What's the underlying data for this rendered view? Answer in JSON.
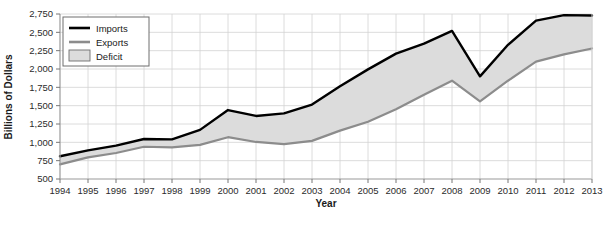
{
  "chart_data": {
    "type": "area",
    "title": "",
    "xlabel": "Year",
    "ylabel": "Billions of Dollars",
    "categories": [
      "1994",
      "1995",
      "1996",
      "1997",
      "1998",
      "1999",
      "2000",
      "2001",
      "2002",
      "2003",
      "2004",
      "2005",
      "2006",
      "2007",
      "2008",
      "2009",
      "2010",
      "2011",
      "2012",
      "2013"
    ],
    "x": [
      1994,
      1995,
      1996,
      1997,
      1998,
      1999,
      2000,
      2001,
      2002,
      2003,
      2004,
      2005,
      2006,
      2007,
      2008,
      2009,
      2010,
      2011,
      2012,
      2013
    ],
    "series": [
      {
        "name": "Imports",
        "color": "#000000",
        "values": [
          810,
          890,
          955,
          1045,
          1040,
          1170,
          1440,
          1360,
          1395,
          1515,
          1765,
          1995,
          2210,
          2345,
          2520,
          1900,
          2330,
          2660,
          2735,
          2730
        ]
      },
      {
        "name": "Exports",
        "color": "#8c8c8c",
        "values": [
          700,
          795,
          855,
          940,
          930,
          965,
          1070,
          1005,
          975,
          1020,
          1160,
          1280,
          1450,
          1650,
          1840,
          1560,
          1840,
          2100,
          2200,
          2280
        ]
      }
    ],
    "fill_between": {
      "name": "Deficit",
      "color": "#dcdcdc",
      "upper_series": "Imports",
      "lower_series": "Exports"
    },
    "ylim": [
      500,
      2750
    ],
    "yticks": [
      500,
      750,
      1000,
      1250,
      1500,
      1750,
      2000,
      2250,
      2500,
      2750
    ],
    "ytick_labels": [
      "500",
      "750",
      "1,000",
      "1,250",
      "1,500",
      "1,750",
      "2,000",
      "2,250",
      "2,500",
      "2,750"
    ],
    "xlim": [
      1994,
      2013
    ],
    "grid": true,
    "grid_color": "#d3d3d3",
    "legend_position": "upper-left",
    "legend": [
      {
        "label": "Imports",
        "marker": "line",
        "color": "#000000"
      },
      {
        "label": "Exports",
        "marker": "line",
        "color": "#8c8c8c"
      },
      {
        "label": "Deficit",
        "marker": "swatch",
        "color": "#dcdcdc"
      }
    ]
  },
  "axes": {
    "ylabel": "Billions of Dollars",
    "xlabel": "Year"
  },
  "legend": {
    "imports_label": "Imports",
    "exports_label": "Exports",
    "deficit_label": "Deficit"
  },
  "caption": {
    "text": ""
  }
}
